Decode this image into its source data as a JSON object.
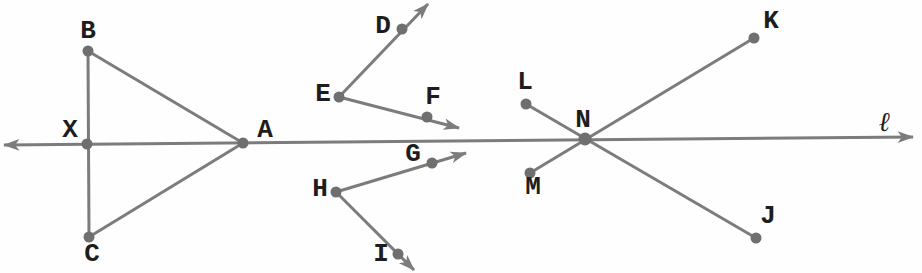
{
  "figure": {
    "width": 922,
    "height": 273,
    "background": "#fefefe",
    "stroke_color": "#7c7c7c",
    "dot_color": "#6f6f6f",
    "label_color": "#1d1d1d",
    "stroke_width": 3,
    "dot_radius": 5.5,
    "line": {
      "name": "l",
      "label": "ℓ",
      "x1": 4,
      "y1": 145,
      "x2": 913,
      "y2": 137,
      "label_x": 884,
      "label_y": 121
    },
    "points": [
      {
        "name": "B",
        "x": 88,
        "y": 51,
        "lx": 88,
        "ly": 31
      },
      {
        "name": "X",
        "x": 87,
        "y": 144,
        "lx": 70,
        "ly": 130
      },
      {
        "name": "C",
        "x": 89,
        "y": 237,
        "lx": 92,
        "ly": 254
      },
      {
        "name": "A",
        "x": 243,
        "y": 143,
        "lx": 265,
        "ly": 130
      },
      {
        "name": "D",
        "x": 402,
        "y": 29,
        "lx": 383,
        "ly": 26
      },
      {
        "name": "E",
        "x": 339,
        "y": 97,
        "lx": 323,
        "ly": 94
      },
      {
        "name": "F",
        "x": 427,
        "y": 117,
        "lx": 433,
        "ly": 97
      },
      {
        "name": "G",
        "x": 432,
        "y": 163,
        "lx": 413,
        "ly": 154
      },
      {
        "name": "H",
        "x": 336,
        "y": 192,
        "lx": 320,
        "ly": 189
      },
      {
        "name": "I",
        "x": 398,
        "y": 254,
        "lx": 381,
        "ly": 254
      },
      {
        "name": "L",
        "x": 526,
        "y": 104,
        "lx": 525,
        "ly": 82
      },
      {
        "name": "M",
        "x": 530,
        "y": 173,
        "lx": 533,
        "ly": 187
      },
      {
        "name": "N",
        "x": 585,
        "y": 139,
        "lx": 583,
        "ly": 120,
        "r": 6.5
      },
      {
        "name": "K",
        "x": 754,
        "y": 38,
        "lx": 771,
        "ly": 21
      },
      {
        "name": "J",
        "x": 756,
        "y": 238,
        "lx": 768,
        "ly": 216
      }
    ],
    "segments": [
      {
        "name": "BC",
        "x1": 88,
        "y1": 51,
        "x2": 89,
        "y2": 237
      },
      {
        "name": "BA",
        "x1": 88,
        "y1": 51,
        "x2": 243,
        "y2": 143
      },
      {
        "name": "CA",
        "x1": 89,
        "y1": 237,
        "x2": 243,
        "y2": 143
      },
      {
        "name": "LJ",
        "x1": 526,
        "y1": 104,
        "x2": 756,
        "y2": 238
      },
      {
        "name": "MK",
        "x1": 530,
        "y1": 173,
        "x2": 754,
        "y2": 38
      }
    ],
    "rays": [
      {
        "name": "ED",
        "x1": 339,
        "y1": 97,
        "x2": 428,
        "y2": 4
      },
      {
        "name": "EF",
        "x1": 339,
        "y1": 97,
        "x2": 459,
        "y2": 128
      },
      {
        "name": "HG",
        "x1": 336,
        "y1": 192,
        "x2": 466,
        "y2": 153
      },
      {
        "name": "HI",
        "x1": 336,
        "y1": 192,
        "x2": 414,
        "y2": 270
      }
    ]
  }
}
